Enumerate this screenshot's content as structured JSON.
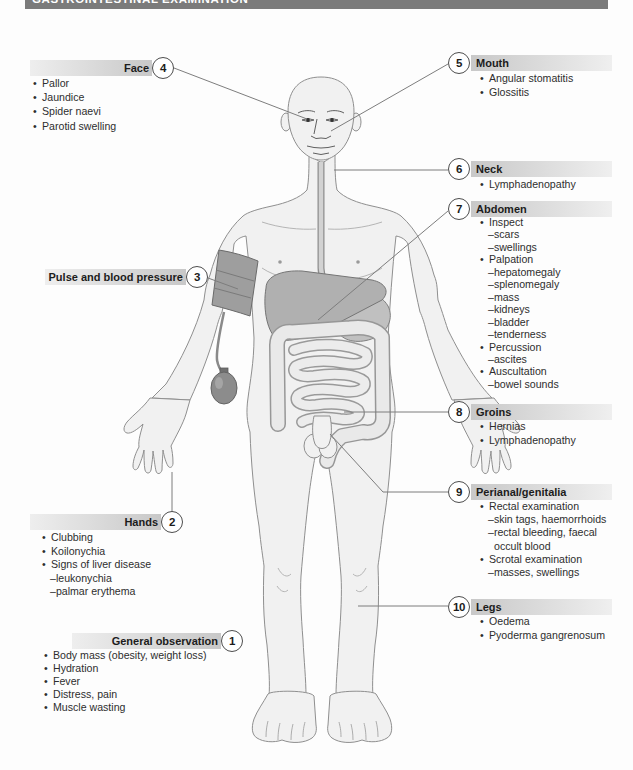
{
  "banner": {
    "title": "GASTROINTESTINAL EXAMINATION"
  },
  "colors": {
    "banner_bg": "#7b7b7b",
    "label_bar_dark": "#c8c8c8",
    "label_bar_light": "#eeeeee",
    "circle_border": "#4d4d4d",
    "connector_line": "#7d7d7d",
    "body_fill": "#f1f1f1",
    "body_outline": "#8f8f8f"
  },
  "sections": {
    "general": {
      "number": "1",
      "title": "General observation",
      "items": [
        {
          "m": "b",
          "t": "Body mass (obesity, weight loss)"
        },
        {
          "m": "b",
          "t": "Hydration"
        },
        {
          "m": "b",
          "t": "Fever"
        },
        {
          "m": "b",
          "t": "Distress, pain"
        },
        {
          "m": "b",
          "t": "Muscle wasting"
        }
      ]
    },
    "hands": {
      "number": "2",
      "title": "Hands",
      "items": [
        {
          "m": "b",
          "t": "Clubbing"
        },
        {
          "m": "b",
          "t": "Koilonychia"
        },
        {
          "m": "b",
          "t": "Signs of liver disease"
        },
        {
          "m": "d",
          "t": "leukonychia"
        },
        {
          "m": "d",
          "t": "palmar erythema"
        }
      ]
    },
    "pulse": {
      "number": "3",
      "title": "Pulse and blood pressure",
      "items": []
    },
    "face": {
      "number": "4",
      "title": "Face",
      "items": [
        {
          "m": "b",
          "t": "Pallor"
        },
        {
          "m": "b",
          "t": "Jaundice"
        },
        {
          "m": "b",
          "t": "Spider naevi"
        },
        {
          "m": "b",
          "t": "Parotid swelling"
        }
      ]
    },
    "mouth": {
      "number": "5",
      "title": "Mouth",
      "items": [
        {
          "m": "b",
          "t": "Angular stomatitis"
        },
        {
          "m": "b",
          "t": "Glossitis"
        }
      ]
    },
    "neck": {
      "number": "6",
      "title": "Neck",
      "items": [
        {
          "m": "b",
          "t": "Lymphadenopathy"
        }
      ]
    },
    "abdomen": {
      "number": "7",
      "title": "Abdomen",
      "items": [
        {
          "m": "b",
          "t": "Inspect"
        },
        {
          "m": "d",
          "t": "scars"
        },
        {
          "m": "d",
          "t": "swellings"
        },
        {
          "m": "b",
          "t": "Palpation"
        },
        {
          "m": "d",
          "t": "hepatomegaly"
        },
        {
          "m": "d",
          "t": "splenomegaly"
        },
        {
          "m": "d",
          "t": "mass"
        },
        {
          "m": "d",
          "t": "kidneys"
        },
        {
          "m": "d",
          "t": "bladder"
        },
        {
          "m": "d",
          "t": "tenderness"
        },
        {
          "m": "b",
          "t": "Percussion"
        },
        {
          "m": "d",
          "t": "ascites"
        },
        {
          "m": "b",
          "t": "Auscultation"
        },
        {
          "m": "d",
          "t": "bowel sounds"
        }
      ]
    },
    "groins": {
      "number": "8",
      "title": "Groins",
      "items": [
        {
          "m": "b",
          "t": "Hernias"
        },
        {
          "m": "b",
          "t": "Lymphadenopathy"
        }
      ]
    },
    "perianal": {
      "number": "9",
      "title": "Perianal/genitalia",
      "items": [
        {
          "m": "b",
          "t": "Rectal examination"
        },
        {
          "m": "d",
          "t": "skin tags, haemorrhoids"
        },
        {
          "m": "d",
          "t": "rectal bleeding, faecal"
        },
        {
          "m": "n",
          "t": "occult blood"
        },
        {
          "m": "b",
          "t": "Scrotal examination"
        },
        {
          "m": "d",
          "t": "masses, swellings"
        }
      ]
    },
    "legs": {
      "number": "10",
      "title": "Legs",
      "items": [
        {
          "m": "b",
          "t": "Oedema"
        },
        {
          "m": "b",
          "t": "Pyoderma gangrenosum"
        }
      ]
    }
  }
}
